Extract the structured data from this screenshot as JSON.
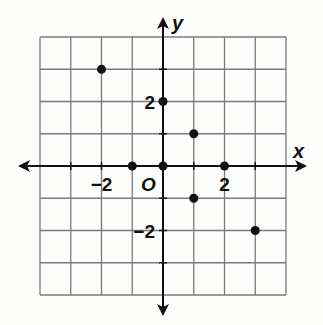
{
  "chart_data": {
    "type": "scatter",
    "title": "",
    "xlabel": "x",
    "ylabel": "y",
    "origin_label": "O",
    "xlim": [
      -4,
      4
    ],
    "ylim": [
      -4,
      4
    ],
    "grid": true,
    "x_ticks_labeled": [
      {
        "value": -2,
        "label": "−2"
      },
      {
        "value": 2,
        "label": "2"
      }
    ],
    "y_ticks_labeled": [
      {
        "value": 2,
        "label": "2"
      },
      {
        "value": -2,
        "label": "−2"
      }
    ],
    "points": [
      {
        "x": -2,
        "y": 3
      },
      {
        "x": 0,
        "y": 2
      },
      {
        "x": 1,
        "y": 1
      },
      {
        "x": -1,
        "y": 0
      },
      {
        "x": 0,
        "y": 0
      },
      {
        "x": 2,
        "y": 0
      },
      {
        "x": 1,
        "y": -1
      },
      {
        "x": 3,
        "y": -2
      }
    ]
  },
  "colors": {
    "grid": "#7a7a7a",
    "axis": "#111111",
    "point": "#111111",
    "background": "#fdfdfc"
  }
}
